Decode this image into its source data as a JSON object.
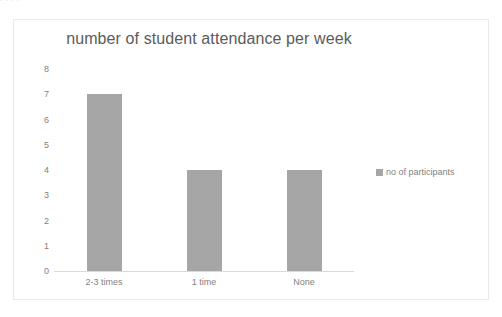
{
  "page": {
    "background_color": "#ffffff",
    "top_fragment_text": "· ·    ·     ·"
  },
  "chart_frame": {
    "border_color": "#eaeaea",
    "background_color": "#ffffff"
  },
  "legend": {
    "swatch_icon": "legend-square-icon",
    "label": "no of participants",
    "color": "#a6a6a6",
    "position": "right"
  },
  "chart_data": {
    "type": "bar",
    "title": "number of student attendance per week",
    "xlabel": "",
    "ylabel": "",
    "categories": [
      "2-3 times",
      "1 time",
      "None"
    ],
    "values": [
      7,
      4,
      4
    ],
    "series": [
      {
        "name": "no of participants",
        "values": [
          7,
          4,
          4
        ],
        "color": "#a6a6a6"
      }
    ],
    "ylim": [
      0,
      8
    ],
    "ytick_step": 1,
    "yticks": [
      8,
      7,
      6,
      5,
      4,
      3,
      2,
      1,
      0
    ],
    "grid": false,
    "legend_position": "right",
    "title_color": "#5b5b5b",
    "tick_label_color": "#7f7f7f"
  }
}
